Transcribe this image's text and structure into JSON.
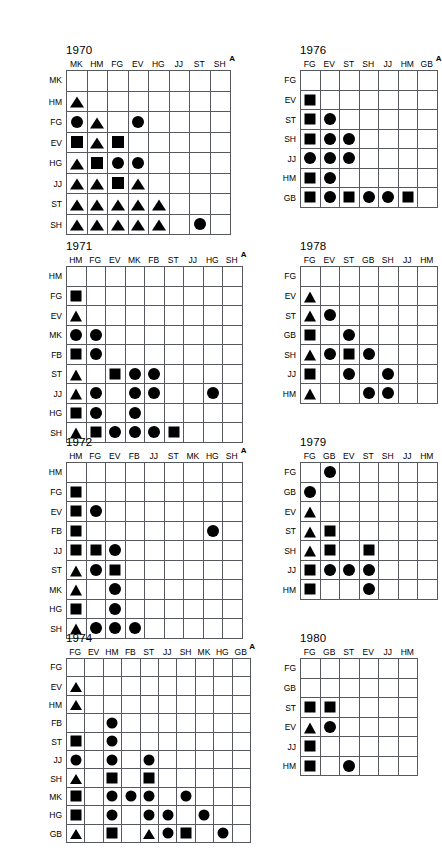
{
  "figure": {
    "type": "matrix-grid-series",
    "superscript_marker": "A",
    "symbols": {
      "circle": "filled-circle",
      "square": "filled-square",
      "triangle": "filled-triangle"
    }
  },
  "panels": [
    {
      "id": "p1970",
      "title": "1970",
      "marker": "A",
      "cols": [
        "MK",
        "HM",
        "FG",
        "EV",
        "HG",
        "JJ",
        "ST",
        "SH"
      ],
      "rows": [
        "MK",
        "HM",
        "FG",
        "EV",
        "HG",
        "JJ",
        "ST",
        "SH"
      ],
      "cells": [
        [
          "",
          "",
          "",
          "",
          "",
          "",
          "",
          ""
        ],
        [
          "triangle",
          "",
          "",
          "",
          "",
          "",
          "",
          ""
        ],
        [
          "circle",
          "triangle",
          "",
          "circle",
          "",
          "",
          "",
          ""
        ],
        [
          "square",
          "triangle",
          "square",
          "",
          "",
          "",
          "",
          ""
        ],
        [
          "triangle",
          "square",
          "circle",
          "circle",
          "",
          "",
          "",
          ""
        ],
        [
          "triangle",
          "triangle",
          "square",
          "triangle",
          "",
          "",
          "",
          ""
        ],
        [
          "triangle",
          "triangle",
          "triangle",
          "triangle",
          "triangle",
          "",
          "",
          ""
        ],
        [
          "triangle",
          "triangle",
          "triangle",
          "triangle",
          "triangle",
          "",
          "circle",
          ""
        ]
      ]
    },
    {
      "id": "p1976",
      "title": "1976",
      "marker": "A",
      "cols": [
        "FG",
        "EV",
        "ST",
        "SH",
        "JJ",
        "HM",
        "GB"
      ],
      "rows": [
        "FG",
        "EV",
        "ST",
        "SH",
        "JJ",
        "HM",
        "GB"
      ],
      "cells": [
        [
          "",
          "",
          "",
          "",
          "",
          "",
          ""
        ],
        [
          "square",
          "",
          "",
          "",
          "",
          "",
          ""
        ],
        [
          "square",
          "circle",
          "",
          "",
          "",
          "",
          ""
        ],
        [
          "square",
          "circle",
          "circle",
          "",
          "",
          "",
          ""
        ],
        [
          "circle",
          "circle",
          "circle",
          "",
          "",
          "",
          ""
        ],
        [
          "square",
          "circle",
          "",
          "",
          "",
          "",
          ""
        ],
        [
          "square",
          "circle",
          "square",
          "circle",
          "circle",
          "square",
          ""
        ]
      ]
    },
    {
      "id": "p1971",
      "title": "1971",
      "marker": "A",
      "cols": [
        "HM",
        "FG",
        "EV",
        "MK",
        "FB",
        "ST",
        "JJ",
        "HG",
        "SH"
      ],
      "rows": [
        "HM",
        "FG",
        "EV",
        "MK",
        "FB",
        "ST",
        "JJ",
        "HG",
        "SH"
      ],
      "cells": [
        [
          "",
          "",
          "",
          "",
          "",
          "",
          "",
          "",
          ""
        ],
        [
          "square",
          "",
          "",
          "",
          "",
          "",
          "",
          "",
          ""
        ],
        [
          "triangle",
          "",
          "",
          "",
          "",
          "",
          "",
          "",
          ""
        ],
        [
          "circle",
          "circle",
          "",
          "",
          "",
          "",
          "",
          "",
          ""
        ],
        [
          "square",
          "circle",
          "",
          "",
          "",
          "",
          "",
          "",
          ""
        ],
        [
          "triangle",
          "",
          "square",
          "circle",
          "circle",
          "",
          "",
          "",
          ""
        ],
        [
          "triangle",
          "circle",
          "",
          "circle",
          "circle",
          "",
          "",
          "circle",
          ""
        ],
        [
          "square",
          "circle",
          "",
          "circle",
          "",
          "",
          "",
          "",
          ""
        ],
        [
          "triangle",
          "square",
          "circle",
          "circle",
          "circle",
          "square",
          "",
          "",
          ""
        ]
      ]
    },
    {
      "id": "p1978",
      "title": "1978",
      "marker": "",
      "cols": [
        "FG",
        "EV",
        "ST",
        "GB",
        "SH",
        "JJ",
        "HM"
      ],
      "rows": [
        "FG",
        "EV",
        "ST",
        "GB",
        "SH",
        "JJ",
        "HM"
      ],
      "cells": [
        [
          "",
          "",
          "",
          "",
          "",
          "",
          ""
        ],
        [
          "triangle",
          "",
          "",
          "",
          "",
          "",
          ""
        ],
        [
          "triangle",
          "circle",
          "",
          "",
          "",
          "",
          ""
        ],
        [
          "square",
          "",
          "circle",
          "",
          "",
          "",
          ""
        ],
        [
          "triangle",
          "circle",
          "square",
          "circle",
          "",
          "",
          ""
        ],
        [
          "square",
          "",
          "circle",
          "",
          "circle",
          "",
          ""
        ],
        [
          "triangle",
          "",
          "",
          "circle",
          "circle",
          "",
          ""
        ]
      ]
    },
    {
      "id": "p1972",
      "title": "1972",
      "marker": "A",
      "cols": [
        "HM",
        "FG",
        "EV",
        "FB",
        "JJ",
        "ST",
        "MK",
        "HG",
        "SH"
      ],
      "rows": [
        "HM",
        "FG",
        "EV",
        "FB",
        "JJ",
        "ST",
        "MK",
        "HG",
        "SH"
      ],
      "cells": [
        [
          "",
          "",
          "",
          "",
          "",
          "",
          "",
          "",
          ""
        ],
        [
          "square",
          "",
          "",
          "",
          "",
          "",
          "",
          "",
          ""
        ],
        [
          "square",
          "circle",
          "",
          "",
          "",
          "",
          "",
          "",
          ""
        ],
        [
          "square",
          "",
          "",
          "",
          "",
          "",
          "",
          "circle",
          ""
        ],
        [
          "square",
          "square",
          "circle",
          "",
          "",
          "",
          "",
          "",
          ""
        ],
        [
          "triangle",
          "circle",
          "square",
          "",
          "",
          "",
          "",
          "",
          ""
        ],
        [
          "triangle",
          "",
          "circle",
          "",
          "",
          "",
          "",
          "",
          ""
        ],
        [
          "square",
          "",
          "circle",
          "",
          "",
          "",
          "",
          "",
          ""
        ],
        [
          "triangle",
          "circle",
          "circle",
          "circle",
          "",
          "",
          "",
          "",
          ""
        ]
      ]
    },
    {
      "id": "p1979",
      "title": "1979",
      "marker": "",
      "cols": [
        "FG",
        "GB",
        "EV",
        "ST",
        "SH",
        "JJ",
        "HM"
      ],
      "rows": [
        "FG",
        "GB",
        "EV",
        "ST",
        "SH",
        "JJ",
        "HM"
      ],
      "cells": [
        [
          "",
          "circle",
          "",
          "",
          "",
          "",
          ""
        ],
        [
          "circle",
          "",
          "",
          "",
          "",
          "",
          ""
        ],
        [
          "triangle",
          "",
          "",
          "",
          "",
          "",
          ""
        ],
        [
          "triangle",
          "square",
          "",
          "",
          "",
          "",
          ""
        ],
        [
          "triangle",
          "square",
          "",
          "square",
          "",
          "",
          ""
        ],
        [
          "square",
          "circle",
          "circle",
          "circle",
          "",
          "",
          ""
        ],
        [
          "square",
          "",
          "",
          "circle",
          "",
          "",
          ""
        ]
      ]
    },
    {
      "id": "p1974",
      "title": "1974",
      "marker": "A",
      "cols": [
        "FG",
        "EV",
        "HM",
        "FB",
        "ST",
        "JJ",
        "SH",
        "MK",
        "HG",
        "GB"
      ],
      "rows": [
        "FG",
        "EV",
        "HM",
        "FB",
        "ST",
        "JJ",
        "SH",
        "MK",
        "HG",
        "GB"
      ],
      "cells": [
        [
          "",
          "",
          "",
          "",
          "",
          "",
          "",
          "",
          "",
          ""
        ],
        [
          "triangle",
          "",
          "",
          "",
          "",
          "",
          "",
          "",
          "",
          ""
        ],
        [
          "triangle",
          "",
          "",
          "",
          "",
          "",
          "",
          "",
          "",
          ""
        ],
        [
          "",
          "",
          "circle",
          "",
          "",
          "",
          "",
          "",
          "",
          ""
        ],
        [
          "square",
          "",
          "circle",
          "",
          "",
          "",
          "",
          "",
          "",
          ""
        ],
        [
          "circle",
          "",
          "circle",
          "",
          "circle",
          "",
          "",
          "",
          "",
          ""
        ],
        [
          "triangle",
          "",
          "square",
          "",
          "square",
          "",
          "",
          "",
          "",
          ""
        ],
        [
          "square",
          "",
          "circle",
          "circle",
          "circle",
          "",
          "circle",
          "",
          "",
          ""
        ],
        [
          "square",
          "",
          "circle",
          "",
          "circle",
          "circle",
          "",
          "circle",
          "",
          ""
        ],
        [
          "triangle",
          "",
          "square",
          "",
          "triangle",
          "circle",
          "square",
          "",
          "circle",
          ""
        ]
      ]
    },
    {
      "id": "p1980",
      "title": "1980",
      "marker": "",
      "cols": [
        "FG",
        "GB",
        "ST",
        "EV",
        "JJ",
        "HM"
      ],
      "rows": [
        "FG",
        "GB",
        "ST",
        "EV",
        "JJ",
        "HM"
      ],
      "cells": [
        [
          "",
          "",
          "",
          "",
          "",
          ""
        ],
        [
          "",
          "",
          "",
          "",
          "",
          ""
        ],
        [
          "square",
          "square",
          "",
          "",
          "",
          ""
        ],
        [
          "triangle",
          "circle",
          "",
          "",
          "",
          ""
        ],
        [
          "square",
          "",
          "",
          "",
          "",
          ""
        ],
        [
          "square",
          "",
          "circle",
          "",
          "",
          ""
        ]
      ]
    }
  ],
  "layout": {
    "p1970": {
      "left": 42,
      "top": 44,
      "cell": 20.5,
      "rowhead": 0,
      "labelw": 24
    },
    "p1976": {
      "left": 276,
      "top": 44,
      "cell": 19.5,
      "rowhead": 0,
      "labelw": 24
    },
    "p1971": {
      "left": 42,
      "top": 240,
      "cell": 19.5,
      "rowhead": 0,
      "labelw": 24
    },
    "p1978": {
      "left": 276,
      "top": 240,
      "cell": 19.5,
      "rowhead": 0,
      "labelw": 24
    },
    "p1972": {
      "left": 42,
      "top": 436,
      "cell": 19.5,
      "rowhead": 0,
      "labelw": 24
    },
    "p1979": {
      "left": 276,
      "top": 436,
      "cell": 19.5,
      "rowhead": 0,
      "labelw": 24
    },
    "p1974": {
      "left": 42,
      "top": 632,
      "cell": 18.4,
      "rowhead": 0,
      "labelw": 24
    },
    "p1980": {
      "left": 276,
      "top": 632,
      "cell": 19.5,
      "rowhead": 0,
      "labelw": 24
    }
  }
}
